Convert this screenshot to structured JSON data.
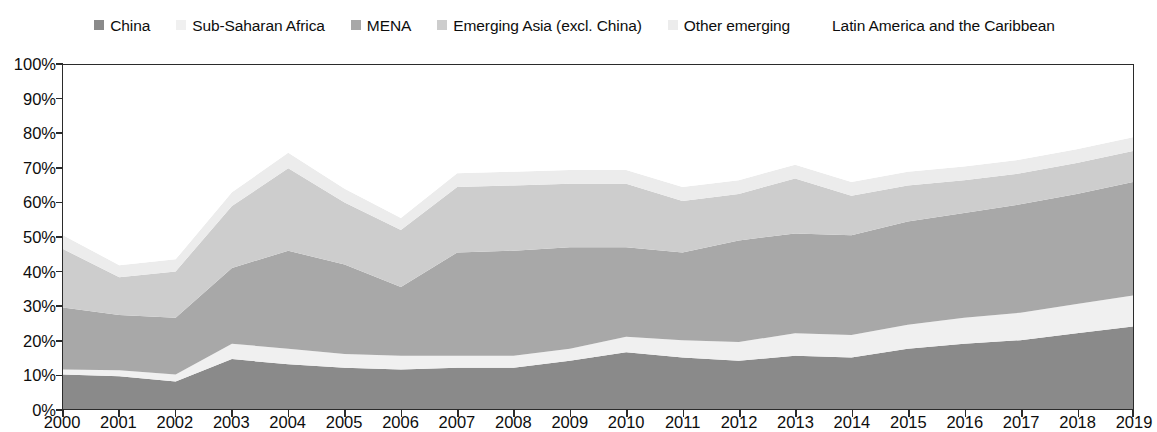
{
  "chart_data": {
    "type": "area",
    "stacked": true,
    "title": "",
    "subtitle": "",
    "xlabel": "",
    "ylabel": "",
    "grid": false,
    "legend_position": "top",
    "x": [
      2000,
      2001,
      2002,
      2003,
      2004,
      2005,
      2006,
      2007,
      2008,
      2009,
      2010,
      2011,
      2012,
      2013,
      2014,
      2015,
      2016,
      2017,
      2018,
      2019
    ],
    "categories": [
      "2000",
      "2001",
      "2002",
      "2003",
      "2004",
      "2005",
      "2006",
      "2007",
      "2008",
      "2009",
      "2010",
      "2011",
      "2012",
      "2013",
      "2014",
      "2015",
      "2016",
      "2017",
      "2018",
      "2019"
    ],
    "ylim": [
      0,
      100
    ],
    "y_ticks": [
      0,
      10,
      20,
      30,
      40,
      50,
      60,
      70,
      80,
      90,
      100
    ],
    "y_tick_labels": [
      "0%",
      "10%",
      "20%",
      "30%",
      "40%",
      "50%",
      "60%",
      "70%",
      "80%",
      "90%",
      "100%"
    ],
    "series": [
      {
        "name": "China",
        "color": "#8a8a8a",
        "values": [
          10.0,
          9.5,
          8.0,
          14.5,
          13.0,
          12.0,
          11.5,
          12.0,
          12.0,
          14.0,
          16.5,
          15.0,
          14.0,
          15.5,
          15.0,
          17.5,
          19.0,
          20.0,
          22.0,
          24.0
        ]
      },
      {
        "name": "Sub-Saharan Africa",
        "color": "#f0f0f0",
        "values": [
          1.5,
          1.8,
          2.0,
          4.5,
          4.5,
          4.0,
          4.0,
          3.5,
          3.5,
          3.5,
          4.5,
          5.0,
          5.5,
          6.5,
          6.5,
          7.0,
          7.5,
          8.0,
          8.5,
          9.0
        ]
      },
      {
        "name": "MENA",
        "color": "#a8a8a8",
        "values": [
          18.0,
          16.0,
          16.5,
          22.0,
          28.5,
          26.0,
          20.0,
          30.0,
          30.5,
          29.5,
          26.0,
          25.5,
          29.5,
          29.0,
          29.0,
          30.0,
          30.5,
          31.5,
          32.0,
          33.0
        ]
      },
      {
        "name": "Emerging Asia (excl. China)",
        "color": "#cdcdcd",
        "values": [
          17.0,
          11.0,
          13.5,
          18.0,
          24.0,
          18.0,
          16.5,
          19.0,
          19.0,
          18.5,
          18.5,
          15.0,
          13.5,
          16.0,
          11.5,
          10.5,
          9.5,
          9.0,
          9.0,
          9.0
        ]
      },
      {
        "name": "Other emerging",
        "color": "#ececec",
        "values": [
          4.0,
          3.5,
          3.5,
          4.0,
          4.5,
          4.0,
          3.5,
          4.0,
          4.0,
          4.0,
          4.0,
          4.0,
          4.0,
          4.0,
          4.0,
          4.0,
          4.0,
          4.0,
          4.0,
          4.0
        ]
      },
      {
        "name": "Latin America and the Caribbean",
        "color": "#ffffff",
        "values": [
          49.5,
          58.2,
          56.5,
          37.0,
          25.5,
          36.0,
          44.5,
          31.5,
          31.0,
          30.5,
          30.5,
          35.5,
          33.5,
          29.0,
          34.0,
          31.0,
          29.5,
          27.5,
          24.5,
          21.0
        ]
      }
    ],
    "cumulative_tops": {
      "China": [
        10.0,
        9.5,
        8.0,
        14.5,
        13.0,
        12.0,
        11.5,
        12.0,
        12.0,
        14.0,
        16.5,
        15.0,
        14.0,
        15.5,
        15.0,
        17.5,
        19.0,
        20.0,
        22.0,
        24.0
      ],
      "Sub-Saharan Africa": [
        11.5,
        11.3,
        10.0,
        19.0,
        17.5,
        16.0,
        15.5,
        15.5,
        15.5,
        17.5,
        21.0,
        20.0,
        19.5,
        22.0,
        21.5,
        24.5,
        26.5,
        28.0,
        30.5,
        33.0
      ],
      "MENA": [
        29.5,
        27.3,
        26.5,
        41.0,
        46.0,
        42.0,
        35.5,
        45.5,
        46.0,
        47.0,
        47.0,
        45.5,
        49.0,
        51.0,
        50.5,
        54.5,
        57.0,
        59.5,
        62.5,
        66.0
      ],
      "Emerging Asia (excl. China)": [
        46.5,
        38.3,
        40.0,
        59.0,
        70.0,
        60.0,
        52.0,
        64.5,
        65.0,
        65.5,
        65.5,
        60.5,
        62.5,
        67.0,
        62.0,
        65.0,
        66.5,
        68.5,
        71.5,
        75.0
      ],
      "Other emerging": [
        50.5,
        41.8,
        43.5,
        63.0,
        74.5,
        64.0,
        55.5,
        68.5,
        69.0,
        69.5,
        69.5,
        64.5,
        66.5,
        71.0,
        66.0,
        69.0,
        70.5,
        72.5,
        75.5,
        79.0
      ],
      "Latin America and the Caribbean": [
        100,
        100,
        100,
        100,
        100,
        100,
        100,
        100,
        100,
        100,
        100,
        100,
        100,
        100,
        100,
        100,
        100,
        100,
        100,
        100
      ]
    }
  },
  "legend": {
    "items": [
      {
        "label": "China",
        "color": "#8a8a8a"
      },
      {
        "label": "Sub-Saharan Africa",
        "color": "#f0f0f0"
      },
      {
        "label": "MENA",
        "color": "#a8a8a8"
      },
      {
        "label": "Emerging Asia (excl. China)",
        "color": "#cdcdcd"
      },
      {
        "label": "Other emerging",
        "color": "#ececec"
      },
      {
        "label": "Latin America and the Caribbean",
        "color": "#ffffff"
      }
    ]
  },
  "axes": {
    "y_tick_labels": [
      "100%",
      "90%",
      "80%",
      "70%",
      "60%",
      "50%",
      "40%",
      "30%",
      "20%",
      "10%",
      "0%"
    ],
    "x_tick_labels": [
      "2000",
      "2001",
      "2002",
      "2003",
      "2004",
      "2005",
      "2006",
      "2007",
      "2008",
      "2009",
      "2010",
      "2011",
      "2012",
      "2013",
      "2014",
      "2015",
      "2016",
      "2017",
      "2018",
      "2019"
    ]
  }
}
